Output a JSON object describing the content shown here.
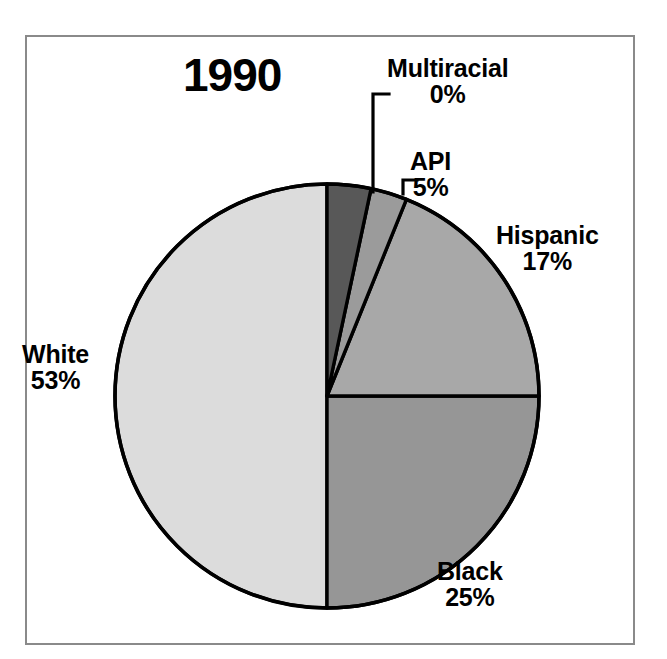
{
  "figure": {
    "title": "1990",
    "frame_color": "#8a8a8a",
    "background": "#ffffff"
  },
  "chart_data": {
    "type": "pie",
    "title": "1990",
    "xlabel": "",
    "ylabel": "",
    "legend_position": "none",
    "grid": false,
    "start_angle_deg": 0,
    "direction": "clockwise",
    "center": {
      "x": 327,
      "y": 396
    },
    "radius": 212,
    "categories": [
      "Multiracial",
      "API",
      "Hispanic",
      "Black",
      "White"
    ],
    "values": [
      0,
      5,
      17,
      25,
      53
    ],
    "value_labels": [
      "0%",
      "5%",
      "17%",
      "25%",
      "53%"
    ],
    "slice_colors": [
      "#585858",
      "#9b9b9b",
      "#a8a8a8",
      "#969696",
      "#dcdcdc"
    ],
    "slice_angles_deg": [
      {
        "name": "Multiracial",
        "start": 0,
        "end": 12
      },
      {
        "name": "API",
        "start": 12,
        "end": 22
      },
      {
        "name": "Hispanic",
        "start": 22,
        "end": 90
      },
      {
        "name": "Black",
        "start": 90,
        "end": 180
      },
      {
        "name": "White",
        "start": 180,
        "end": 360
      }
    ],
    "slices": [
      {
        "label": "Multiracial",
        "percent_text": "0%",
        "value": 0,
        "color": "#585858"
      },
      {
        "label": "API",
        "percent_text": "5%",
        "value": 5,
        "color": "#9b9b9b"
      },
      {
        "label": "Hispanic",
        "percent_text": "17%",
        "value": 17,
        "color": "#a8a8a8"
      },
      {
        "label": "Black",
        "percent_text": "25%",
        "value": 25,
        "color": "#969696"
      },
      {
        "label": "White",
        "percent_text": "53%",
        "value": 53,
        "color": "#dcdcdc"
      }
    ],
    "leader_lines": [
      {
        "for": "Multiracial",
        "style": "elbow-vertical"
      },
      {
        "for": "API",
        "style": "elbow-short"
      }
    ]
  },
  "labels": {
    "multiracial": {
      "name": "Multiracial",
      "percent": "0%"
    },
    "api": {
      "name": "API",
      "percent": "5%"
    },
    "hispanic": {
      "name": "Hispanic",
      "percent": "17%"
    },
    "white": {
      "name": "White",
      "percent": "53%"
    },
    "black": {
      "name": "Black",
      "percent": "25%"
    }
  }
}
